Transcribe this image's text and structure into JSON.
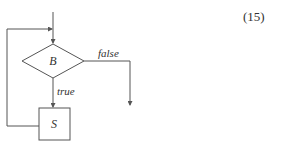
{
  "equation_number": "(15)",
  "flowchart": {
    "condition_label": "B",
    "statement_label": "S",
    "true_label": "true",
    "false_label": "false"
  },
  "colors": {
    "stroke": "#555555",
    "text": "#333333"
  }
}
